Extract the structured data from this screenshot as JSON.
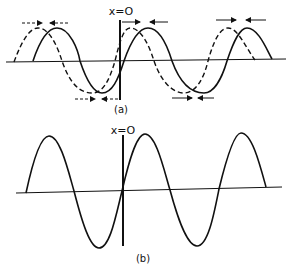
{
  "panel_a": {
    "origin_label": "x=O",
    "caption": "(a)",
    "solid_wave": "displaced wave",
    "dashed_wave": "reference wave"
  },
  "panel_b": {
    "origin_label": "x=O",
    "caption": "(b)"
  },
  "colors": {
    "ink": "#111111",
    "background": "#ffffff"
  }
}
